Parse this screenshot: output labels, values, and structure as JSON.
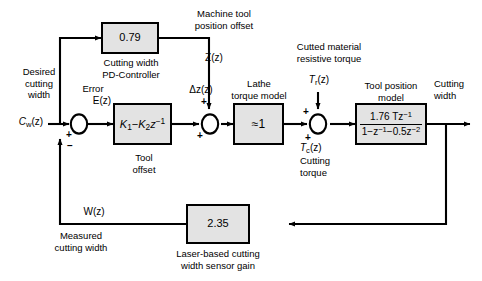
{
  "diagram": {
    "background": "#ffffff",
    "block_fill": "#e3e3e3",
    "line_color": "#000000"
  },
  "blocks": {
    "position_offset_gain": {
      "value": "0.79",
      "caption_line1": "Cutting width",
      "caption_line2": "PD-Controller"
    },
    "pd_controller": {
      "expr_k1": "K",
      "expr_k1_sub": "1",
      "expr_minus": "−",
      "expr_k2": "K",
      "expr_k2_sub": "2",
      "expr_z": "z",
      "expr_z_sup": "−1"
    },
    "lathe_torque_model": {
      "value": "≈1",
      "caption_line1": "Lathe",
      "caption_line2": "torque model"
    },
    "tool_position_model": {
      "numerator": "1.76 Tz",
      "numerator_sup": "−1",
      "denominator_a": "1−z",
      "denominator_a_sup": "−1",
      "denominator_b": "−0.5z",
      "denominator_b_sup": "−2",
      "caption_line1": "Tool position",
      "caption_line2": "model"
    },
    "sensor_gain": {
      "value": "2.35",
      "caption_line1": "Laser-based cutting",
      "caption_line2": "width sensor gain"
    }
  },
  "signals": {
    "reference_label_line1": "Desired",
    "reference_label_line2": "cutting",
    "reference_label_line3": "width",
    "reference_symbol": "C",
    "reference_symbol_sub": "w",
    "reference_symbol_tail": "(z)",
    "error_label": "Error",
    "error_symbol": "E(z)",
    "delta_z_symbol": "Δz(z)",
    "tool_offset_line1": "Tool",
    "tool_offset_line2": "offset",
    "machine_offset_line1": "Machine tool",
    "machine_offset_line2": "position offset",
    "z_symbol": "Z(z)",
    "resistive_torque_line1": "Cutted material",
    "resistive_torque_line2": "resistive torque",
    "tr_symbol": "T",
    "tr_symbol_sub": "r",
    "tr_symbol_tail": "(z)",
    "tc_symbol": "T",
    "tc_symbol_sub": "c",
    "tc_symbol_tail": "(z)",
    "cutting_torque_line1": "Cutting",
    "cutting_torque_line2": "torque",
    "output_label_line1": "Cutting",
    "output_label_line2": "width",
    "feedback_symbol": "W(z)",
    "measured_line1": "Measured",
    "measured_line2": "cutting width"
  },
  "summing_junctions": {
    "error_junction": {
      "input_sign": "+",
      "feedback_sign": "–"
    },
    "offset_junction": {
      "input_sign": "+",
      "top_sign": "+"
    },
    "torque_junction": {
      "input_sign": "+",
      "top_sign": "+"
    }
  }
}
